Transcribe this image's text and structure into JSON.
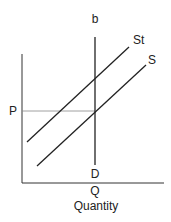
{
  "diagram": {
    "labels": {
      "top": "b",
      "supply_tax": "St",
      "supply": "S",
      "price": "P",
      "demand": "D",
      "quantity_point": "Q",
      "x_axis": "Quantity"
    },
    "colors": {
      "line": "#222222",
      "guide": "#888888"
    }
  }
}
